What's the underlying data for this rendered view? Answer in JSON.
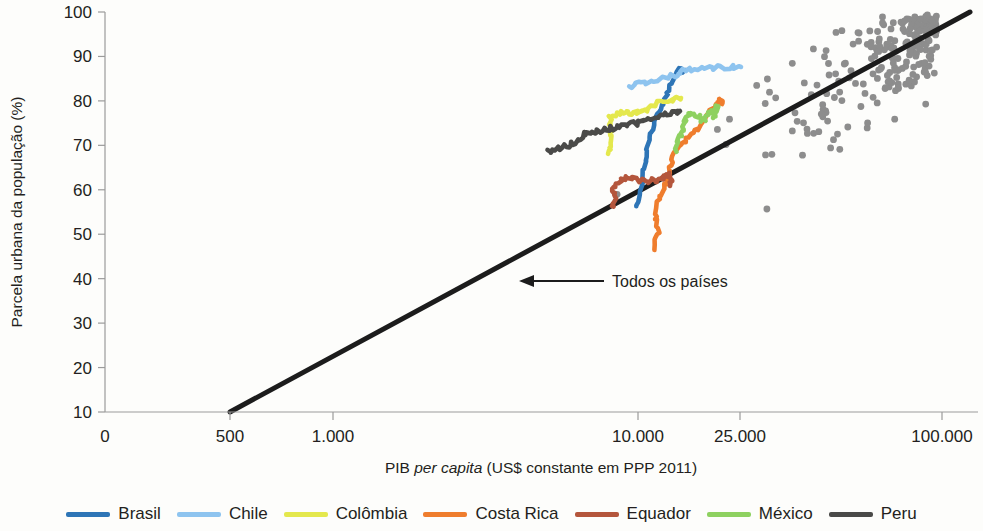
{
  "chart_data": {
    "type": "scatter",
    "title": "",
    "xlabel": "PIB per capita (US$ constante em PPP 2011)",
    "xlabel_plain": "PIB ",
    "xlabel_italic": "per capita",
    "xlabel_tail": " (US$ constante em PPP 2011)",
    "ylabel": "Parcela urbana da população (%)",
    "x_scale": "log",
    "x_ticks": [
      {
        "label": "0",
        "value": 0,
        "px": 105
      },
      {
        "label": "500",
        "value": 500,
        "px": 230
      },
      {
        "label": "1.000",
        "value": 1000,
        "px": 333
      },
      {
        "label": "10.000",
        "value": 10000,
        "px": 638
      },
      {
        "label": "25.000",
        "value": 25000,
        "px": 740
      },
      {
        "label": "100.000",
        "value": 100000,
        "px": 942
      }
    ],
    "y_ticks": [
      {
        "label": "100",
        "value": 100
      },
      {
        "label": "90",
        "value": 90
      },
      {
        "label": "80",
        "value": 80
      },
      {
        "label": "70",
        "value": 70
      },
      {
        "label": "60",
        "value": 60
      },
      {
        "label": "50",
        "value": 50
      },
      {
        "label": "40",
        "value": 40
      },
      {
        "label": "30",
        "value": 30
      },
      {
        "label": "20",
        "value": 20
      },
      {
        "label": "10",
        "value": 10
      }
    ],
    "ylim": [
      10,
      100
    ],
    "grid": false,
    "legend_position": "bottom",
    "annotation": {
      "text": "Todos os países",
      "arrow": "left-arrow",
      "x_px": 612,
      "y_px": 281
    },
    "trendline": {
      "name": "Todos os países",
      "color": "#1c1c1c",
      "x_start_px": 230,
      "y_start_px": 412,
      "x_end_px": 970,
      "y_end_px": 12,
      "description": "Linha de tendência log-linear atravessando todos os países"
    },
    "series": [
      {
        "name": "Brasil",
        "color": "#2e75b6",
        "points_px": [
          [
            637,
            206
          ],
          [
            639,
            197
          ],
          [
            641,
            188
          ],
          [
            643,
            179
          ],
          [
            645,
            170
          ],
          [
            647,
            160
          ],
          [
            648,
            151
          ],
          [
            649,
            142
          ],
          [
            651,
            133
          ],
          [
            653,
            125
          ],
          [
            656,
            118
          ],
          [
            659,
            112
          ],
          [
            662,
            106
          ],
          [
            665,
            100
          ],
          [
            668,
            95
          ],
          [
            670,
            89
          ],
          [
            672,
            83
          ],
          [
            674,
            77
          ],
          [
            676,
            72
          ],
          [
            678,
            68
          ]
        ]
      },
      {
        "name": "Chile",
        "color": "#8ec4ef",
        "points_px": [
          [
            628,
            86
          ],
          [
            635,
            84
          ],
          [
            643,
            82
          ],
          [
            651,
            80
          ],
          [
            659,
            79
          ],
          [
            667,
            78
          ],
          [
            675,
            77
          ],
          [
            683,
            73
          ],
          [
            691,
            70
          ],
          [
            699,
            69
          ],
          [
            707,
            69
          ],
          [
            715,
            68
          ],
          [
            723,
            68
          ],
          [
            731,
            67
          ],
          [
            739,
            67
          ],
          [
            744,
            67
          ]
        ]
      },
      {
        "name": "Colômbia",
        "color": "#e4e84d",
        "points_px": [
          [
            609,
            153
          ],
          [
            611,
            146
          ],
          [
            613,
            140
          ],
          [
            612,
            134
          ],
          [
            610,
            128
          ],
          [
            609,
            122
          ],
          [
            612,
            117
          ],
          [
            616,
            114
          ],
          [
            621,
            112
          ],
          [
            627,
            112
          ],
          [
            633,
            113
          ],
          [
            639,
            112
          ],
          [
            645,
            110
          ],
          [
            651,
            107
          ],
          [
            657,
            104
          ],
          [
            663,
            101
          ],
          [
            669,
            100
          ],
          [
            675,
            99
          ],
          [
            678,
            98
          ]
        ]
      },
      {
        "name": "Costa Rica",
        "color": "#ef7d2d"
      },
      {
        "name": "Equador",
        "color": "#b4563c"
      },
      {
        "name": "México",
        "color": "#8ed160"
      },
      {
        "name": "Peru",
        "color": "#4a4a48"
      }
    ],
    "scatter_note": "Nuvem de pontos cinza representando todos os países",
    "scatter_count": 230
  },
  "legend": {
    "items": [
      {
        "label": "Brasil",
        "color": "#2e75b6"
      },
      {
        "label": "Chile",
        "color": "#8ec4ef"
      },
      {
        "label": "Colômbia",
        "color": "#e4e84d"
      },
      {
        "label": "Costa Rica",
        "color": "#ef7d2d"
      },
      {
        "label": "Equador",
        "color": "#b4563c"
      },
      {
        "label": "México",
        "color": "#8ed160"
      },
      {
        "label": "Peru",
        "color": "#4a4a48"
      }
    ]
  }
}
